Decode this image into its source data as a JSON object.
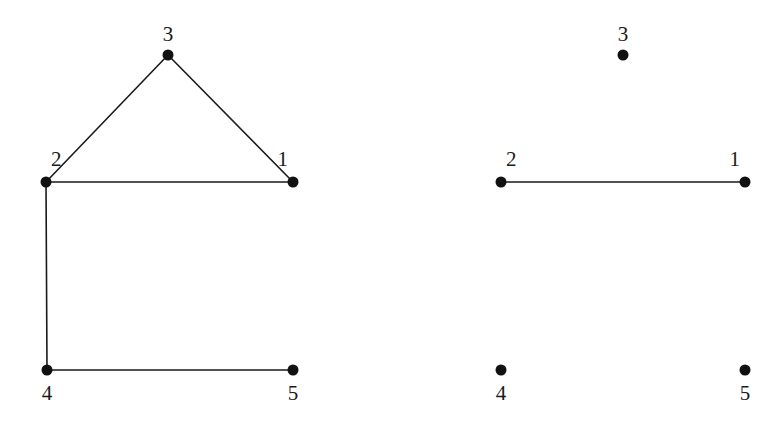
{
  "figure": {
    "title": "",
    "background_color": "#ffffff",
    "ink_color": "#1a1a1a",
    "vertex_color": "#111111",
    "vertex_radius": 5.5,
    "edge_width": 1.6,
    "label_font_size": 21,
    "width": 782,
    "height": 424
  },
  "graphs": [
    {
      "id": "left-graph",
      "name": "left-graph",
      "caption": "",
      "nodes": [
        {
          "id": "1",
          "label": "1",
          "x": 293,
          "y": 182,
          "label_x": 288,
          "label_y": 166,
          "label_anchor": "end"
        },
        {
          "id": "2",
          "label": "2",
          "x": 46,
          "y": 182,
          "label_x": 51,
          "label_y": 166,
          "label_anchor": "start"
        },
        {
          "id": "3",
          "label": "3",
          "x": 168,
          "y": 55,
          "label_x": 168,
          "label_y": 41,
          "label_anchor": "middle"
        },
        {
          "id": "4",
          "label": "4",
          "x": 47,
          "y": 370,
          "label_x": 47,
          "label_y": 400,
          "label_anchor": "middle"
        },
        {
          "id": "5",
          "label": "5",
          "x": 293,
          "y": 370,
          "label_x": 293,
          "label_y": 400,
          "label_anchor": "middle"
        }
      ],
      "edges": [
        {
          "from": "2",
          "to": "3"
        },
        {
          "from": "3",
          "to": "1"
        },
        {
          "from": "2",
          "to": "1"
        },
        {
          "from": "2",
          "to": "4"
        },
        {
          "from": "4",
          "to": "5"
        }
      ]
    },
    {
      "id": "right-graph",
      "name": "right-graph",
      "caption": "",
      "nodes": [
        {
          "id": "1",
          "label": "1",
          "x": 745,
          "y": 182,
          "label_x": 740,
          "label_y": 166,
          "label_anchor": "end"
        },
        {
          "id": "2",
          "label": "2",
          "x": 501,
          "y": 182,
          "label_x": 506,
          "label_y": 166,
          "label_anchor": "start"
        },
        {
          "id": "3",
          "label": "3",
          "x": 623,
          "y": 55,
          "label_x": 623,
          "label_y": 41,
          "label_anchor": "middle"
        },
        {
          "id": "4",
          "label": "4",
          "x": 501,
          "y": 370,
          "label_x": 501,
          "label_y": 400,
          "label_anchor": "middle"
        },
        {
          "id": "5",
          "label": "5",
          "x": 745,
          "y": 370,
          "label_x": 745,
          "label_y": 400,
          "label_anchor": "middle"
        }
      ],
      "edges": [
        {
          "from": "2",
          "to": "1"
        }
      ]
    }
  ],
  "chart_data": {
    "type": "diagram",
    "subtype": "graph-node-link",
    "title": "",
    "xlabel": "",
    "ylabel": "",
    "panels": [
      {
        "name": "left-graph",
        "vertices": [
          "1",
          "2",
          "3",
          "4",
          "5"
        ],
        "edge_list": [
          [
            "2",
            "3"
          ],
          [
            "3",
            "1"
          ],
          [
            "2",
            "1"
          ],
          [
            "2",
            "4"
          ],
          [
            "4",
            "5"
          ]
        ],
        "edge_count": 5,
        "vertex_count": 5,
        "positions": {
          "1": [
            293,
            182
          ],
          "2": [
            46,
            182
          ],
          "3": [
            168,
            55
          ],
          "4": [
            47,
            370
          ],
          "5": [
            293,
            370
          ]
        }
      },
      {
        "name": "right-graph",
        "vertices": [
          "1",
          "2",
          "3",
          "4",
          "5"
        ],
        "edge_list": [
          [
            "2",
            "1"
          ]
        ],
        "edge_count": 1,
        "vertex_count": 5,
        "positions": {
          "1": [
            745,
            182
          ],
          "2": [
            501,
            182
          ],
          "3": [
            623,
            55
          ],
          "4": [
            501,
            370
          ],
          "5": [
            745,
            370
          ]
        }
      }
    ]
  }
}
